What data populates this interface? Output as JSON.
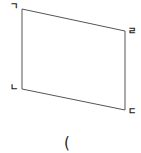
{
  "figure": {
    "shape": "parallelogram",
    "stroke_color": "#555555",
    "vertices": [
      {
        "label": "ㄱ",
        "x": 22,
        "y": 9
      },
      {
        "label": "ㄹ",
        "x": 125,
        "y": 31
      },
      {
        "label": "ㄷ",
        "x": 125,
        "y": 110
      },
      {
        "label": "ㄴ",
        "x": 22,
        "y": 89
      }
    ],
    "labels": {
      "top_left": "ㄱ",
      "top_right": "ㄹ",
      "bottom_left": "ㄴ",
      "bottom_right": "ㄷ"
    },
    "caption": "("
  }
}
